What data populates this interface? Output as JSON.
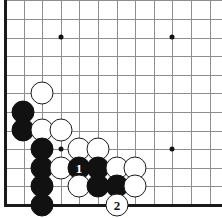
{
  "diagram": {
    "board": {
      "background_color": "#ffffff",
      "line_color": "#8e8e8e",
      "edge_color": "#1a1a1a",
      "origin_x": 5,
      "origin_y": 0,
      "cell": 18.6,
      "bottom_edge_y": 205,
      "left_edge_x": 5,
      "columns": 12,
      "rows": 12
    },
    "star_points": [
      {
        "name": "hoshi-upper-left",
        "x": 61,
        "y": 37
      },
      {
        "name": "hoshi-upper-right",
        "x": 172,
        "y": 37
      },
      {
        "name": "hoshi-lower-left",
        "x": 61,
        "y": 149
      },
      {
        "name": "hoshi-lower-right",
        "x": 172,
        "y": 149
      }
    ],
    "stones": [
      {
        "name": "stone-white-c4",
        "color": "white",
        "x": 42,
        "y": 93,
        "radius": 11.5,
        "label": ""
      },
      {
        "name": "stone-black-b5",
        "color": "black",
        "x": 23,
        "y": 112,
        "radius": 11.5,
        "label": ""
      },
      {
        "name": "stone-black-b6",
        "color": "black",
        "x": 23,
        "y": 130,
        "radius": 11.5,
        "label": ""
      },
      {
        "name": "stone-white-c6",
        "color": "white",
        "x": 42,
        "y": 130,
        "radius": 11.5,
        "label": ""
      },
      {
        "name": "stone-white-d6",
        "color": "white",
        "x": 61,
        "y": 130,
        "radius": 11.5,
        "label": ""
      },
      {
        "name": "stone-black-c7",
        "color": "black",
        "x": 42,
        "y": 149,
        "radius": 11.5,
        "label": ""
      },
      {
        "name": "stone-white-e7",
        "color": "white",
        "x": 79,
        "y": 149,
        "radius": 11.5,
        "label": ""
      },
      {
        "name": "stone-white-f7",
        "color": "white",
        "x": 98,
        "y": 149,
        "radius": 11.5,
        "label": ""
      },
      {
        "name": "stone-black-c8",
        "color": "black",
        "x": 42,
        "y": 168,
        "radius": 11.5,
        "label": ""
      },
      {
        "name": "stone-white-d8",
        "color": "white",
        "x": 61,
        "y": 168,
        "radius": 11.5,
        "label": ""
      },
      {
        "name": "stone-black-move-1",
        "color": "black",
        "x": 79,
        "y": 168,
        "radius": 11.5,
        "label": "1"
      },
      {
        "name": "stone-black-f8",
        "color": "black",
        "x": 98,
        "y": 168,
        "radius": 11.5,
        "label": ""
      },
      {
        "name": "stone-white-g8",
        "color": "white",
        "x": 117,
        "y": 168,
        "radius": 11.5,
        "label": ""
      },
      {
        "name": "stone-white-h8",
        "color": "white",
        "x": 135,
        "y": 168,
        "radius": 11.5,
        "label": ""
      },
      {
        "name": "stone-black-c9",
        "color": "black",
        "x": 42,
        "y": 186,
        "radius": 11.5,
        "label": ""
      },
      {
        "name": "stone-white-e9",
        "color": "white",
        "x": 79,
        "y": 186,
        "radius": 11.5,
        "label": ""
      },
      {
        "name": "stone-black-f9",
        "color": "black",
        "x": 98,
        "y": 186,
        "radius": 11.5,
        "label": ""
      },
      {
        "name": "stone-black-g9",
        "color": "black",
        "x": 117,
        "y": 186,
        "radius": 11.5,
        "label": ""
      },
      {
        "name": "stone-white-h9",
        "color": "white",
        "x": 135,
        "y": 186,
        "radius": 11.5,
        "label": ""
      },
      {
        "name": "stone-black-c10",
        "color": "black",
        "x": 42,
        "y": 205,
        "radius": 11.5,
        "label": ""
      },
      {
        "name": "stone-white-move-2",
        "color": "white",
        "x": 117,
        "y": 205,
        "radius": 11.5,
        "label": "2"
      }
    ],
    "move_markers": [
      {
        "number": "1",
        "color": "black"
      },
      {
        "number": "2",
        "color": "white"
      }
    ]
  }
}
